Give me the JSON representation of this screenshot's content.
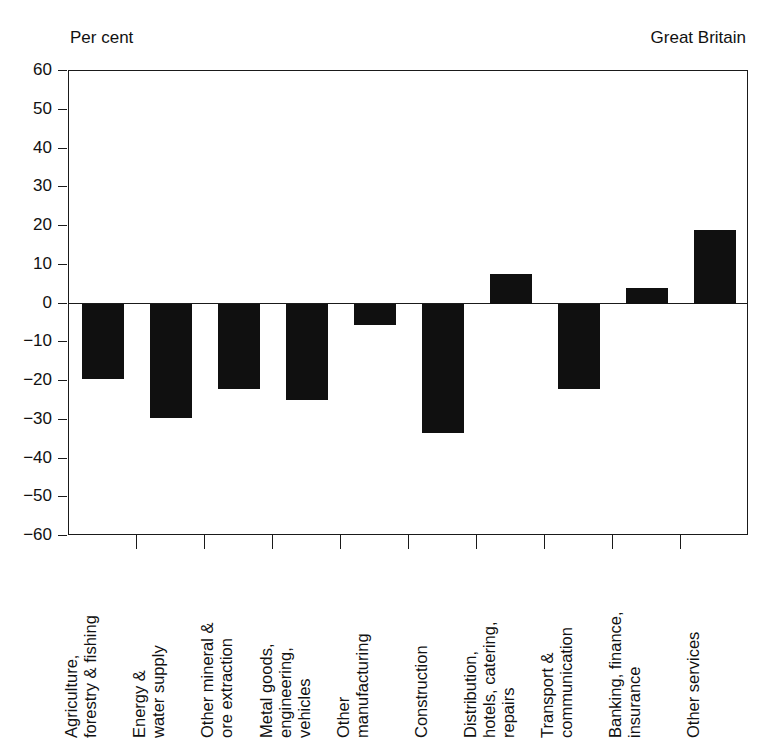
{
  "header": {
    "unit_label": "Per cent",
    "region_label": "Great Britain"
  },
  "chart_data": {
    "type": "bar",
    "title": "",
    "subtitle": "",
    "xlabel": "",
    "ylabel": "Per cent",
    "region": "Great Britain",
    "ylim": [
      -60,
      60
    ],
    "yticks": [
      60,
      50,
      40,
      30,
      20,
      10,
      0,
      -10,
      -20,
      -30,
      -40,
      -50,
      -60
    ],
    "ytick_labels": [
      "60",
      "50",
      "40",
      "30",
      "20",
      "10",
      "0",
      "−10",
      "−20",
      "−30",
      "−40",
      "−50",
      "−60"
    ],
    "grid": false,
    "legend": false,
    "bar_color": "#101010",
    "categories": [
      "Agriculture, forestry & fishing",
      "Energy & water supply",
      "Other mineral & ore extraction",
      "Metal goods, engineering, vehicles",
      "Other manufacturing",
      "Construction",
      "Distribution, hotels, catering, repairs",
      "Transport & communication",
      "Banking, finance, insurance",
      "Other services"
    ],
    "category_lines": [
      [
        "Agriculture,",
        "forestry & fishing"
      ],
      [
        "Energy &",
        "water supply"
      ],
      [
        "Other mineral &",
        "ore extraction"
      ],
      [
        "Metal goods,",
        "engineering,",
        "vehicles"
      ],
      [
        "Other",
        "manufacturing"
      ],
      [
        "Construction"
      ],
      [
        "Distribution,",
        "hotels, catering,",
        "repairs"
      ],
      [
        "Transport &",
        "communication"
      ],
      [
        "Banking, finance,",
        "insurance"
      ],
      [
        "Other services"
      ]
    ],
    "values": [
      -19.5,
      -29.5,
      -22.0,
      -25.0,
      -5.5,
      -33.5,
      7.5,
      -22.0,
      4.0,
      19.0
    ]
  }
}
